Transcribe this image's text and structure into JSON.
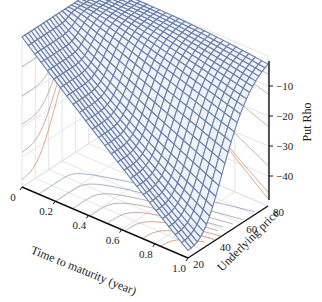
{
  "chart_data": {
    "type": "surface",
    "title": "",
    "xlabel": "Time to maturity (year)",
    "ylabel": "Underlying price",
    "zlabel": "Put Rho",
    "x_ticks": [
      "0",
      "0.2",
      "0.4",
      "0.6",
      "0.8",
      "1.0"
    ],
    "y_ticks": [
      "20",
      "40",
      "60",
      "80"
    ],
    "z_ticks": [
      "-10",
      "-20",
      "-30",
      "-40"
    ],
    "xlim": [
      0,
      1.0
    ],
    "ylim": [
      20,
      80
    ],
    "zlim": [
      -50,
      0
    ],
    "model": {
      "strike": 50,
      "rate": 0.05,
      "volatility": 0.3
    },
    "grid_resolution": 26,
    "contour_projections": true,
    "colors": {
      "mesh": "#6b7fa8",
      "mesh_fill": "#eef3fb",
      "contour_low": "#d98c5f",
      "contour_high": "#8fa0c8",
      "axis": "#111111",
      "pane_grid": "#dddddd"
    }
  }
}
